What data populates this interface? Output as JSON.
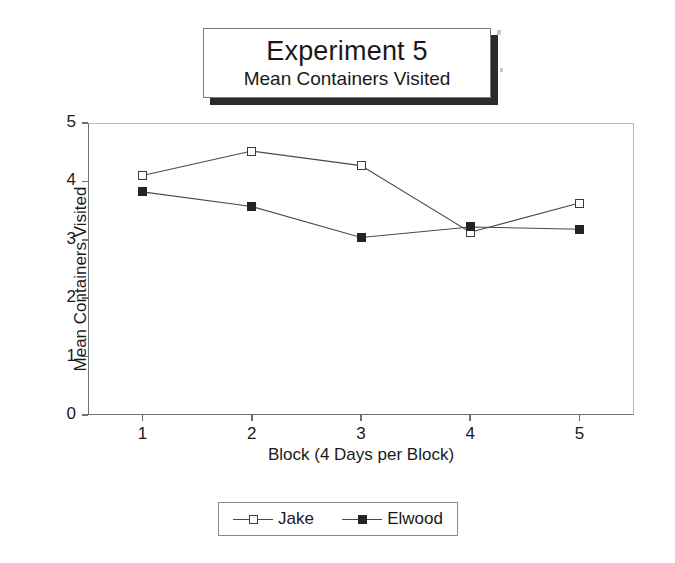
{
  "title": {
    "main": "Experiment 5",
    "sub": "Mean Containers Visited"
  },
  "legend": {
    "entries": [
      {
        "label": "Jake",
        "marker": "open-square-icon"
      },
      {
        "label": "Elwood",
        "marker": "filled-square-icon"
      }
    ]
  },
  "axes": {
    "x_title": "Block (4 Days per Block)",
    "y_title": "Mean Containers Visited",
    "x_ticks": [
      "1",
      "2",
      "3",
      "4",
      "5"
    ],
    "y_ticks": [
      "0",
      "1",
      "2",
      "3",
      "4",
      "5"
    ]
  },
  "chart_data": {
    "type": "line",
    "xlabel": "Block (4 Days per Block)",
    "ylabel": "Mean Containers Visited",
    "x": [
      1,
      2,
      3,
      4,
      5
    ],
    "categories": [
      "1",
      "2",
      "3",
      "4",
      "5"
    ],
    "xlim": [
      0.5,
      5.5
    ],
    "ylim": [
      0,
      5
    ],
    "yticks": [
      0,
      1,
      2,
      3,
      4,
      5
    ],
    "xticks": [
      1,
      2,
      3,
      4,
      5
    ],
    "grid": false,
    "legend_position": "bottom",
    "series": [
      {
        "name": "Jake",
        "marker": "open square",
        "color": "#3b3b3b",
        "values": [
          4.1,
          4.52,
          4.27,
          3.13,
          3.63
        ]
      },
      {
        "name": "Elwood",
        "marker": "filled square",
        "color": "#242424",
        "values": [
          3.82,
          3.57,
          3.04,
          3.22,
          3.18
        ]
      }
    ]
  }
}
